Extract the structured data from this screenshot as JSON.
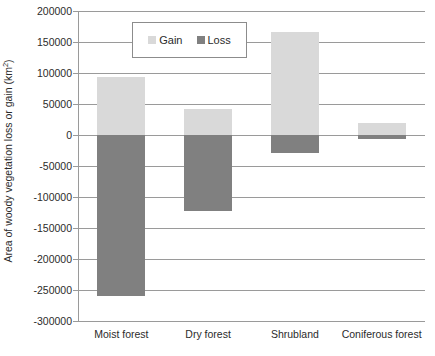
{
  "chart_data": {
    "type": "bar",
    "title": "",
    "subtitle": "",
    "xlabel": "",
    "ylabel": "Area of woody vegetation loss or gain (km",
    "ylabel_superscript": "2",
    "ylabel_suffix": ")",
    "categories": [
      "Moist forest",
      "Dry forest",
      "Shrubland",
      "Coniferous forest"
    ],
    "series": [
      {
        "name": "Gain",
        "values": [
          93000,
          42000,
          166000,
          19000
        ],
        "color": "#d9d9d9"
      },
      {
        "name": "Loss",
        "values": [
          -260000,
          -122000,
          -29000,
          -6000
        ],
        "color": "#808080"
      }
    ],
    "ylim": [
      -300000,
      200000
    ],
    "ytick_step": 50000,
    "ytick_labels": [
      "200000",
      "150000",
      "100000",
      "50000",
      "0",
      "-50000",
      "-100000",
      "-150000",
      "-200000",
      "-250000",
      "-300000"
    ],
    "ytick_values": [
      200000,
      150000,
      100000,
      50000,
      0,
      -50000,
      -100000,
      -150000,
      -200000,
      -250000,
      -300000
    ],
    "grid": true,
    "legend": {
      "position": "top-left-inside",
      "entries": [
        {
          "label": "Gain",
          "color": "#d9d9d9"
        },
        {
          "label": "Loss",
          "color": "#808080"
        }
      ]
    },
    "axis_color": "#9a9a9a",
    "text_color": "#2b2b2b",
    "background": "#ffffff"
  }
}
